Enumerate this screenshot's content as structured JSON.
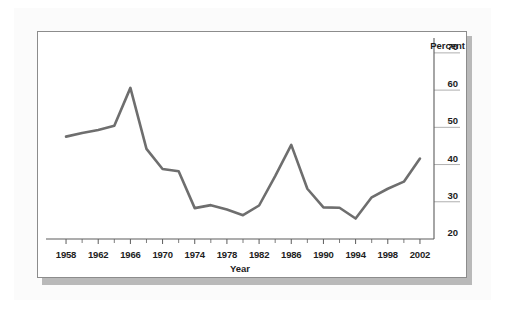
{
  "chart_data": {
    "type": "line",
    "title": "",
    "xlabel": "Year",
    "ylabel": "Percent",
    "unit_label": "Percent",
    "grid": false,
    "legend": "none",
    "xlim": [
      1957,
      2003
    ],
    "ylim": [
      20,
      74
    ],
    "ytick_labels": [
      "70",
      "60",
      "50",
      "40",
      "30",
      "20"
    ],
    "yticks": [
      70,
      60,
      50,
      40,
      30,
      20
    ],
    "xtick_labels": [
      "1958",
      "1962",
      "1966",
      "1970",
      "1974",
      "1978",
      "1982",
      "1986",
      "1990",
      "1994",
      "1998",
      "2002"
    ],
    "xticks": [
      1958,
      1962,
      1966,
      1970,
      1974,
      1978,
      1982,
      1986,
      1990,
      1994,
      1998,
      2002
    ],
    "xminor_ticks": [
      1960,
      1964,
      1968,
      1972,
      1976,
      1980,
      1984,
      1988,
      1992,
      1996,
      2000
    ],
    "line_color": "#6e6e6e",
    "series": [
      {
        "name": "Percent",
        "x": [
          1958,
          1960,
          1962,
          1964,
          1966,
          1968,
          1970,
          1972,
          1974,
          1976,
          1978,
          1980,
          1982,
          1984,
          1986,
          1988,
          1990,
          1992,
          1994,
          1996,
          1998,
          2000,
          2002
        ],
        "values": [
          47.5,
          48.5,
          49.3,
          50.4,
          60.6,
          44.2,
          38.8,
          38.2,
          28.3,
          29.1,
          27.9,
          26.4,
          29.0,
          36.9,
          45.3,
          33.5,
          28.5,
          28.4,
          25.5,
          31.2,
          33.5,
          35.4,
          41.6
        ]
      }
    ]
  },
  "figure": {
    "x_axis_title": "Year",
    "y_unit": "Percent"
  }
}
